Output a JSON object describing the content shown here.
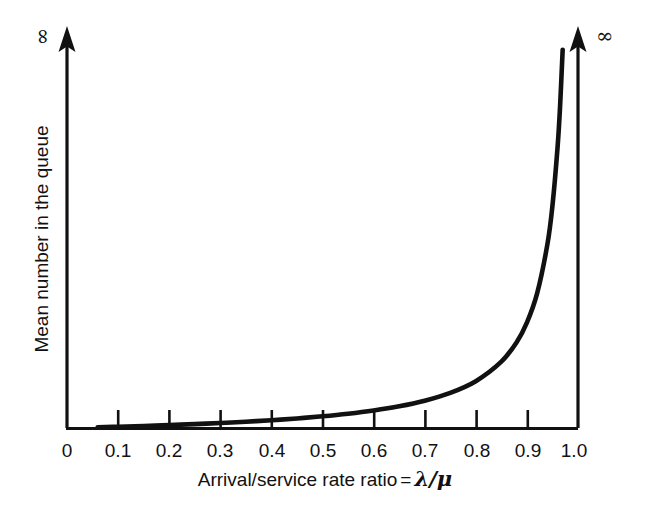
{
  "figure": {
    "background_color": "#ffffff",
    "ink_color": "#111111"
  },
  "axes": {
    "x": {
      "title_prefix": "Arrival/service rate ratio",
      "title_equals": "=",
      "title_numerator": "λ",
      "title_slash": "/",
      "title_denominator": "μ",
      "title_full": "Arrival/service rate ratio = λ/μ",
      "tick_labels": [
        "0",
        "0.1",
        "0.2",
        "0.3",
        "0.4",
        "0.5",
        "0.6",
        "0.7",
        "0.8",
        "0.9",
        "1.0"
      ],
      "tick_values": [
        0,
        0.1,
        0.2,
        0.3,
        0.4,
        0.5,
        0.6,
        0.7,
        0.8,
        0.9,
        1.0
      ]
    },
    "y": {
      "title": "Mean number in the queue",
      "top_label": "∞",
      "tick_labels": []
    },
    "right": {
      "top_label": "∞"
    }
  },
  "chart_data": {
    "type": "line",
    "title": "",
    "xlabel": "Arrival/service rate ratio = λ/μ",
    "ylabel": "Mean number in the queue",
    "xlim": [
      0.0,
      1.0
    ],
    "ylim": [
      0.0,
      30.0
    ],
    "grid": false,
    "legend": "none",
    "annotations": [
      {
        "text": "∞",
        "position": "top-of-y-axis"
      },
      {
        "text": "∞",
        "position": "top-of-right-asymptote"
      }
    ],
    "series": [
      {
        "name": "Mean queue length L = ρ/(1-ρ)",
        "x": [
          0.06,
          0.1,
          0.15,
          0.2,
          0.25,
          0.3,
          0.35,
          0.4,
          0.45,
          0.5,
          0.55,
          0.6,
          0.65,
          0.7,
          0.75,
          0.8,
          0.85,
          0.88,
          0.9,
          0.92,
          0.94,
          0.95,
          0.96,
          0.965,
          0.97
        ],
        "y": [
          0.064,
          0.111,
          0.176,
          0.25,
          0.333,
          0.429,
          0.538,
          0.667,
          0.818,
          1.0,
          1.222,
          1.5,
          1.857,
          2.333,
          3.0,
          4.0,
          5.667,
          7.333,
          9.0,
          11.5,
          15.667,
          19.0,
          24.0,
          27.571,
          32.333
        ]
      }
    ],
    "asymptote": {
      "x": 1.0,
      "label": "∞"
    }
  }
}
